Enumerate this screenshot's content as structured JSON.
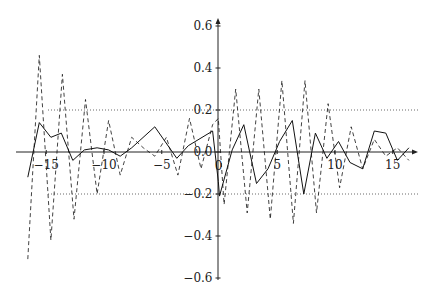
{
  "chart_data": {
    "type": "line",
    "title": "",
    "xlabel": "",
    "ylabel": "",
    "xlim": [
      -17,
      17.5
    ],
    "ylim": [
      -0.62,
      0.65
    ],
    "grid": false,
    "legend": null,
    "x_ticks": [
      -15,
      -10,
      -5,
      0,
      5,
      10,
      15
    ],
    "x_tick_labels": [
      "−15",
      "−10",
      "−5",
      "0",
      "5",
      "10",
      "15"
    ],
    "y_ticks": [
      0.6,
      0.4,
      0.2,
      0.0,
      -0.2,
      -0.4,
      -0.6
    ],
    "y_tick_labels": [
      "0.6",
      "0.4",
      "0.2",
      "0.0",
      "−0.2",
      "−0.4",
      "−0.6"
    ],
    "reference_lines": [
      {
        "y": 0.2,
        "style": "dotted"
      },
      {
        "y": -0.2,
        "style": "dotted"
      }
    ],
    "series": [
      {
        "name": "solid",
        "style": "solid",
        "points": [
          [
            -16.6,
            -0.12
          ],
          [
            -15.6,
            0.14
          ],
          [
            -14.6,
            0.07
          ],
          [
            -13.7,
            0.09
          ],
          [
            -12.7,
            -0.04
          ],
          [
            -11.7,
            0.01
          ],
          [
            -10.6,
            0.02
          ],
          [
            -9.6,
            0.01
          ],
          [
            -8.6,
            -0.02
          ],
          [
            -7.6,
            0.02
          ],
          [
            -5.6,
            0.12
          ],
          [
            -3.7,
            -0.03
          ],
          [
            -2.7,
            0.03
          ],
          [
            -0.6,
            0.1
          ],
          [
            -0.1,
            -0.14
          ],
          [
            0.0,
            -0.21
          ],
          [
            1.1,
            0.01
          ],
          [
            2.1,
            0.13
          ],
          [
            3.2,
            -0.15
          ],
          [
            4.2,
            -0.08
          ],
          [
            5.2,
            0.05
          ],
          [
            6.3,
            0.15
          ],
          [
            7.3,
            -0.2
          ],
          [
            8.3,
            0.09
          ],
          [
            9.3,
            -0.03
          ],
          [
            10.3,
            0.05
          ],
          [
            11.3,
            -0.05
          ],
          [
            12.4,
            -0.08
          ],
          [
            13.4,
            0.1
          ],
          [
            14.4,
            0.09
          ],
          [
            15.4,
            -0.04
          ],
          [
            16.4,
            0.02
          ]
        ]
      },
      {
        "name": "dashed",
        "style": "dashed",
        "points": [
          [
            -16.6,
            -0.51
          ],
          [
            -15.6,
            0.46
          ],
          [
            -14.6,
            -0.42
          ],
          [
            -13.6,
            0.37
          ],
          [
            -12.6,
            -0.32
          ],
          [
            -11.6,
            0.25
          ],
          [
            -10.6,
            -0.2
          ],
          [
            -9.6,
            0.15
          ],
          [
            -8.6,
            -0.11
          ],
          [
            -7.6,
            0.07
          ],
          [
            -6.6,
            0.02
          ],
          [
            -5.6,
            -0.02
          ],
          [
            -4.6,
            0.07
          ],
          [
            -3.6,
            -0.11
          ],
          [
            -2.6,
            0.16
          ],
          [
            -1.6,
            -0.08
          ],
          [
            -0.6,
            0.13
          ],
          [
            -0.1,
            0.16
          ],
          [
            0.4,
            -0.25
          ],
          [
            1.4,
            0.3
          ],
          [
            2.4,
            -0.29
          ],
          [
            3.4,
            0.3
          ],
          [
            4.4,
            -0.32
          ],
          [
            5.4,
            0.34
          ],
          [
            6.4,
            -0.34
          ],
          [
            7.4,
            0.34
          ],
          [
            8.4,
            -0.29
          ],
          [
            9.4,
            0.23
          ],
          [
            10.4,
            -0.17
          ],
          [
            11.4,
            0.12
          ],
          [
            12.4,
            -0.08
          ],
          [
            13.4,
            0.06
          ],
          [
            14.4,
            -0.02
          ],
          [
            15.4,
            0.02
          ],
          [
            16.4,
            -0.04
          ]
        ]
      }
    ]
  }
}
